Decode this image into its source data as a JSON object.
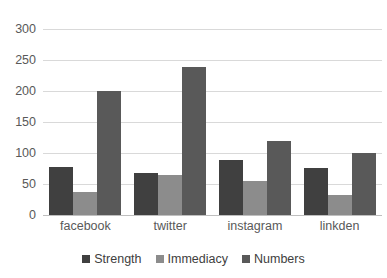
{
  "chart_data": {
    "type": "bar",
    "title": "",
    "xlabel": "",
    "ylabel": "",
    "ylim": [
      0,
      300
    ],
    "yticks": [
      0,
      50,
      100,
      150,
      200,
      250,
      300
    ],
    "grid": true,
    "legend_position": "bottom",
    "categories": [
      "facebook",
      "twitter",
      "instagram",
      "linkden"
    ],
    "series": [
      {
        "name": "Strength",
        "color": "#404040",
        "values": [
          78,
          68,
          89,
          76
        ]
      },
      {
        "name": "Immediacy",
        "color": "#8c8c8c",
        "values": [
          37,
          65,
          55,
          32
        ]
      },
      {
        "name": "Numbers",
        "color": "#595959",
        "values": [
          200,
          239,
          119,
          100
        ]
      }
    ]
  },
  "axis": {
    "y_tick_labels": [
      "300",
      "250",
      "200",
      "150",
      "100",
      "50",
      "0"
    ]
  },
  "colors": {
    "gridline": "#d9d9d9",
    "axis": "#bfbfbf",
    "tick_text": "#595959",
    "legend_text": "#404040",
    "background": "#ffffff"
  }
}
